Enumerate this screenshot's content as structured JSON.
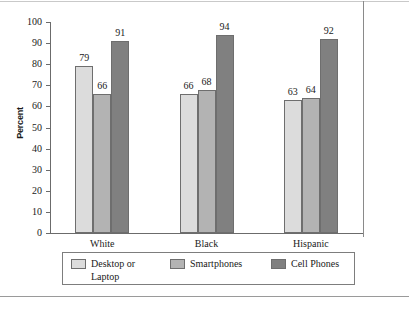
{
  "chart_data": {
    "type": "bar",
    "title": "",
    "xlabel": "",
    "ylabel": "Percent",
    "ylim": [
      0,
      100
    ],
    "grid": false,
    "legend_position": "bottom",
    "categories": [
      "White",
      "Black",
      "Hispanic"
    ],
    "y_ticks": [
      "0",
      "10",
      "20",
      "30",
      "40",
      "50",
      "60",
      "70",
      "80",
      "90",
      "100"
    ],
    "series": [
      {
        "name": "Desktop or\nLaptop",
        "color": "#dcdcdc",
        "values": [
          79,
          66,
          63
        ]
      },
      {
        "name": "Smartphones",
        "color": "#b3b3b3",
        "values": [
          66,
          68,
          64
        ]
      },
      {
        "name": "Cell Phones",
        "color": "#808080",
        "values": [
          91,
          94,
          92
        ]
      }
    ]
  },
  "axis": {
    "y_label": "Percent"
  },
  "colors": {
    "series_light": "#dcdcdc",
    "series_medium": "#b3b3b3",
    "series_dark": "#808080",
    "axis": "#6b6b6b",
    "border": "#7d7d7d"
  }
}
